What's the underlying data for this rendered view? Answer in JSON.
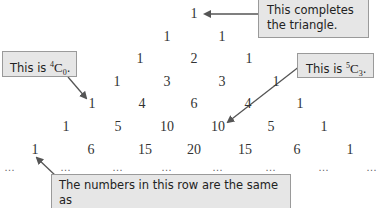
{
  "triangle": {
    "rows": [
      [
        "1"
      ],
      [
        "1",
        "1"
      ],
      [
        "1",
        "2",
        "1"
      ],
      [
        "1",
        "3",
        "3",
        "1"
      ],
      [
        "1",
        "4",
        "6",
        "4",
        "1"
      ],
      [
        "1",
        "5",
        "10",
        "10",
        "5",
        "1"
      ],
      [
        "1",
        "6",
        "15",
        "20",
        "15",
        "6",
        "1"
      ]
    ],
    "continuation": "…"
  },
  "callouts": {
    "top": {
      "text_line1": "This completes",
      "text_line2": "the triangle."
    },
    "c40": {
      "prefix": "This is ",
      "sup": "4",
      "letter": "C",
      "sub": "0",
      "suffix": "."
    },
    "c53": {
      "prefix": "This is ",
      "sup": "5",
      "letter": "C",
      "sub": "3",
      "suffix": "."
    },
    "bottom": {
      "text_line1": "The numbers in this row are the same as",
      "text_line2": "those in the middle row of the table above."
    }
  },
  "colors": {
    "callout_bg": "#e6e6e6",
    "callout_border": "#9a9a9a",
    "arrow": "#555555",
    "number_text": "#333333"
  }
}
